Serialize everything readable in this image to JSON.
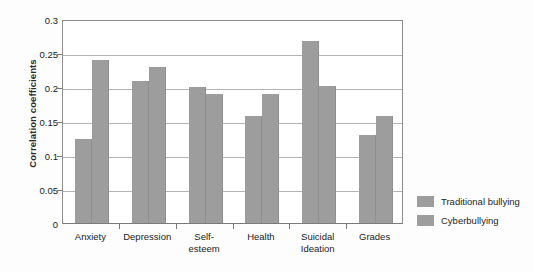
{
  "chart_data": {
    "type": "bar",
    "title": "",
    "xlabel": "",
    "ylabel": "Correlation coefficients",
    "ylim": [
      0,
      0.3
    ],
    "ytick_values": [
      0,
      0.05,
      0.1,
      0.15,
      0.2,
      0.25,
      0.3
    ],
    "ytick_labels": [
      "0",
      "0.05",
      "0.1",
      "0.15",
      "0.2",
      "0.25",
      "0.3"
    ],
    "grid": true,
    "legend_position": "right",
    "categories": [
      "Anxiety",
      "Depression",
      "Self-\nesteem",
      "Health",
      "Suicidal\nIdeation",
      "Grades"
    ],
    "series": [
      {
        "name": "Traditional bullying",
        "color": "#9d9d9d",
        "values": [
          0.123,
          0.209,
          0.2,
          0.158,
          0.268,
          0.129
        ]
      },
      {
        "name": "Cyberbullying",
        "color": "#9d9d9d",
        "values": [
          0.24,
          0.23,
          0.19,
          0.19,
          0.201,
          0.158
        ]
      }
    ]
  },
  "legend": {
    "items": [
      {
        "label": "Traditional bullying",
        "color": "#9d9d9d"
      },
      {
        "label": "Cyberbullying",
        "color": "#9d9d9d"
      }
    ]
  },
  "colors": {
    "bar": "#9d9d9d",
    "gridline": "#b4b4b4",
    "axis": "#7a7a7a",
    "background": "#fdfdfd",
    "plot_background": "#ffffff",
    "text": "#222222"
  }
}
